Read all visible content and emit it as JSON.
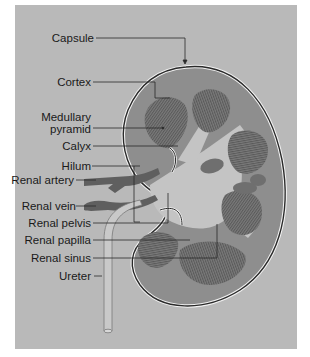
{
  "figure": {
    "colors": {
      "background_panel": "#b9b9b9",
      "cortex": "#8e8e8e",
      "pyramid": "#6f6f6f",
      "sinus": "#c4c4c4",
      "vessel": "#5f5f5f",
      "capsule_outline": "#2a2a2a",
      "leader_line": "#2a2a2a"
    }
  },
  "labels": [
    {
      "id": "capsule",
      "text": "Capsule"
    },
    {
      "id": "cortex",
      "text": "Cortex"
    },
    {
      "id": "medullary_pyramid_1",
      "text": "Medullary"
    },
    {
      "id": "medullary_pyramid_2",
      "text": "pyramid"
    },
    {
      "id": "calyx",
      "text": "Calyx"
    },
    {
      "id": "hilum",
      "text": "Hilum"
    },
    {
      "id": "renal_artery",
      "text": "Renal artery"
    },
    {
      "id": "renal_vein",
      "text": "Renal vein"
    },
    {
      "id": "renal_pelvis",
      "text": "Renal pelvis"
    },
    {
      "id": "renal_papilla",
      "text": "Renal papilla"
    },
    {
      "id": "renal_sinus",
      "text": "Renal sinus"
    },
    {
      "id": "ureter",
      "text": "Ureter"
    }
  ]
}
